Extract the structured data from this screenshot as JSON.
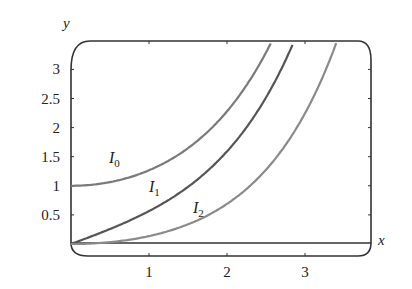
{
  "chart_data": {
    "type": "line",
    "title": "",
    "xlabel": "x",
    "ylabel": "y",
    "xlim": [
      0,
      3.85
    ],
    "ylim": [
      0,
      3.45
    ],
    "x_ticks": [
      "1",
      "2",
      "3"
    ],
    "y_ticks": [
      "0.5",
      "1",
      "1.5",
      "2",
      "2.5",
      "3"
    ],
    "grid": false,
    "legend": "inline labels",
    "series": [
      {
        "name": "I0",
        "label_main": "I",
        "label_sub": "0",
        "color": "#7a7a7a",
        "x": [
          0,
          0.5,
          1,
          1.5,
          2,
          2.5
        ],
        "y": [
          1.0,
          1.06,
          1.27,
          1.65,
          2.28,
          3.29
        ]
      },
      {
        "name": "I1",
        "label_main": "I",
        "label_sub": "1",
        "color": "#555555",
        "x": [
          0,
          0.5,
          1,
          1.5,
          2,
          2.5,
          2.8
        ],
        "y": [
          0,
          0.26,
          0.57,
          0.98,
          1.59,
          2.52,
          3.3
        ]
      },
      {
        "name": "I2",
        "label_main": "I",
        "label_sub": "2",
        "color": "#8a8a8a",
        "x": [
          0,
          0.5,
          1,
          1.5,
          2,
          2.5,
          3,
          3.4
        ],
        "y": [
          0,
          0.03,
          0.14,
          0.34,
          0.69,
          1.28,
          2.25,
          3.3
        ]
      }
    ]
  }
}
